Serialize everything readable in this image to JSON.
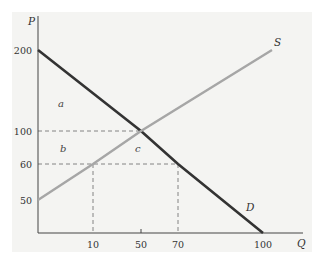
{
  "chart_data": {
    "type": "line",
    "title": "",
    "xlabel": "Q",
    "ylabel": "P",
    "x_ticks": [
      10,
      50,
      70,
      100
    ],
    "y_ticks": [
      50,
      60,
      100,
      200
    ],
    "series": [
      {
        "name": "D",
        "kind": "demand",
        "color": "#333333",
        "points": [
          [
            0,
            200
          ],
          [
            50,
            100
          ],
          [
            70,
            60
          ],
          [
            100,
            0
          ]
        ]
      },
      {
        "name": "S",
        "kind": "supply",
        "color": "#a6a6a6",
        "points": [
          [
            0,
            50
          ],
          [
            10,
            60
          ],
          [
            50,
            100
          ],
          [
            104,
            200
          ]
        ]
      }
    ],
    "guide_lines": [
      {
        "from": [
          0,
          100
        ],
        "to": [
          50,
          100
        ]
      },
      {
        "from": [
          0,
          60
        ],
        "to": [
          70,
          60
        ]
      },
      {
        "from": [
          10,
          60
        ],
        "to": [
          10,
          0
        ]
      },
      {
        "from": [
          70,
          60
        ],
        "to": [
          70,
          0
        ]
      }
    ],
    "region_labels": [
      {
        "text": "a",
        "at": [
          5,
          150
        ]
      },
      {
        "text": "b",
        "at": [
          5,
          82
        ]
      },
      {
        "text": "c",
        "at": [
          50,
          82
        ]
      }
    ],
    "grid": false,
    "legend": "none"
  }
}
